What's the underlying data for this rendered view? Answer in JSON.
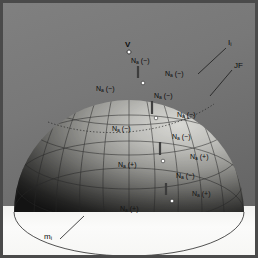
{
  "figure": {
    "type": "3d-hemisphere-wireframe",
    "background_color": "#787878",
    "floor_color": "#f7f7f5",
    "frame_color": "#4a4a4a",
    "mesh_color": "#2b2b2b",
    "marker_color": "#ffffff",
    "tick_color": "#3a3a3a"
  },
  "vertex": {
    "label": "V"
  },
  "callouts": [
    {
      "id": "I",
      "text": "I",
      "sub": "i"
    },
    {
      "id": "JF",
      "text": "JF",
      "sub": ""
    },
    {
      "id": "m",
      "text": "m",
      "sub": "i"
    }
  ],
  "node_labels": [
    {
      "id": "n1",
      "base": "N",
      "sub": "a",
      "sign": "(−)",
      "x": 131,
      "y": 57,
      "tone": "lite"
    },
    {
      "id": "n2",
      "base": "N",
      "sub": "a",
      "sign": "(−)",
      "x": 165,
      "y": 70,
      "tone": "lite"
    },
    {
      "id": "n3",
      "base": "N",
      "sub": "a",
      "sign": "(−)",
      "x": 96,
      "y": 85,
      "tone": "lite"
    },
    {
      "id": "n4",
      "base": "N",
      "sub": "a",
      "sign": "(−)",
      "x": 154,
      "y": 92,
      "tone": "lite"
    },
    {
      "id": "n5",
      "base": "N",
      "sub": "a",
      "sign": "(−)",
      "x": 177,
      "y": 111,
      "tone": "lite"
    },
    {
      "id": "n6",
      "base": "N",
      "sub": "a",
      "sign": "(−)",
      "x": 112,
      "y": 125,
      "tone": "lite"
    },
    {
      "id": "n7",
      "base": "N",
      "sub": "a",
      "sign": "(−)",
      "x": 172,
      "y": 133,
      "tone": "lite"
    },
    {
      "id": "n8",
      "base": "N",
      "sub": "a",
      "sign": "(+)",
      "x": 190,
      "y": 153,
      "tone": "lite"
    },
    {
      "id": "n9",
      "base": "N",
      "sub": "a",
      "sign": "(+)",
      "x": 118,
      "y": 161,
      "tone": "lite"
    },
    {
      "id": "n10",
      "base": "N",
      "sub": "a",
      "sign": "(−)",
      "x": 176,
      "y": 172,
      "tone": "lite"
    },
    {
      "id": "n11",
      "base": "N",
      "sub": "a",
      "sign": "(+)",
      "x": 192,
      "y": 190,
      "tone": "dark"
    },
    {
      "id": "n12",
      "base": "N",
      "sub": "a",
      "sign": "(+)",
      "x": 120,
      "y": 205,
      "tone": "dark"
    }
  ],
  "markers": [
    {
      "x": 129,
      "y": 52
    },
    {
      "x": 143,
      "y": 83
    },
    {
      "x": 156,
      "y": 118
    },
    {
      "x": 163,
      "y": 161
    },
    {
      "x": 172,
      "y": 201
    }
  ],
  "ticks": [
    {
      "x": 138,
      "y": 66,
      "h": 12
    },
    {
      "x": 152,
      "y": 101,
      "h": 13
    },
    {
      "x": 160,
      "y": 142,
      "h": 13
    },
    {
      "x": 166,
      "y": 183,
      "h": 12
    }
  ]
}
